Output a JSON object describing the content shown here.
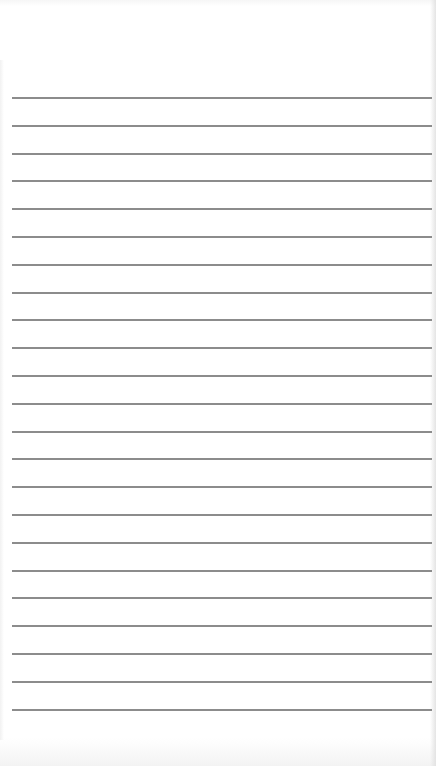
{
  "document": {
    "type": "ruled-paper",
    "background_color": "#ffffff",
    "line_color": "#8c8c8c",
    "line_count": 23,
    "first_line_y": 97,
    "line_spacing": 27.8,
    "line_left": 12,
    "line_right": 432
  }
}
